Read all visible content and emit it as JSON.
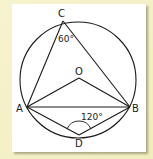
{
  "figure": {
    "type": "circle-geometry",
    "colors": {
      "background": "#f3efc4",
      "panel": "#ffffff",
      "stroke": "#1a1a1a"
    },
    "points": {
      "C": {
        "label": "C"
      },
      "O": {
        "label": "O"
      },
      "A": {
        "label": "A"
      },
      "B": {
        "label": "B"
      },
      "D": {
        "label": "D"
      }
    },
    "angles": {
      "angle_C": {
        "label": "60°",
        "vertex": "C",
        "value": 60
      },
      "angle_D": {
        "label": "120°",
        "vertex": "D",
        "value": 120
      }
    },
    "segments": [
      "CA",
      "CB",
      "OA",
      "OB",
      "AB",
      "AD",
      "BD"
    ]
  }
}
